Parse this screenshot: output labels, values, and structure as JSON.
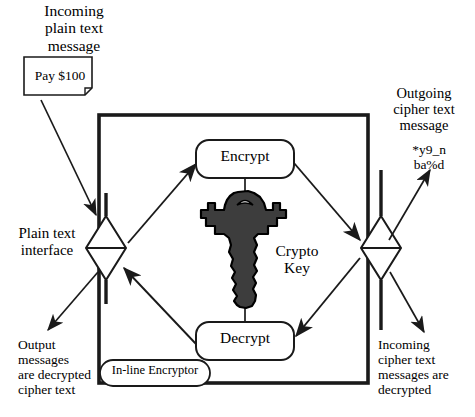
{
  "diagram": {
    "colors": {
      "stroke": "#1a1a1a",
      "key_fill": "#3d3d3d",
      "key_outline": "#000000",
      "background": "#ffffff"
    },
    "annotations": {
      "incoming_plain_message": "Incoming\nplain text\nmessage",
      "outgoing_cipher_message": "Outgoing\ncipher text\nmessage",
      "cipher_text_sample": "*y9_n\nba%d",
      "plain_text_interface": "Plain text\ninterface",
      "output_messages": "Output\nmessages\nare decrypted\ncipher text",
      "incoming_cipher_messages": "Incoming\ncipher text\nmessages are\ndecrypted",
      "crypto_key": "Crypto\nKey"
    },
    "nodes": {
      "plain_note": "Pay $100",
      "encrypt": "Encrypt",
      "decrypt": "Decrypt",
      "device": "In-line Encryptor"
    },
    "icons": {
      "key": "key-icon",
      "note": "document-note-icon",
      "plain_interface": "diamond-interface-icon",
      "cipher_interface": "diamond-interface-icon"
    }
  }
}
